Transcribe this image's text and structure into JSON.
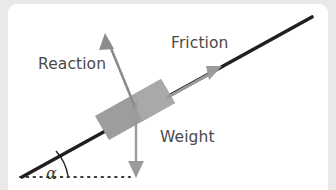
{
  "figure": {
    "background_color": "#e9e9e9",
    "card_color": "#ffffff"
  },
  "labels": {
    "reaction": "Reaction",
    "friction": "Friction",
    "weight": "Weight",
    "angle": "α"
  },
  "colors": {
    "incline": "#231f20",
    "block_fill": "#9e9e9e",
    "block_fill_light": "#b0b0b0",
    "arrow_gray": "#8c8c8c",
    "label_text": "#4a4a4a",
    "angle_text": "#3a3a3a",
    "dotted_baseline": "#3a3a3a"
  },
  "geometry": {
    "incline": {
      "x1": 22,
      "y1": 176,
      "x2": 312,
      "y2": 15,
      "stroke_width": 3.4
    },
    "baseline_dotted": {
      "x1": 20,
      "y1": 177,
      "x2": 128,
      "y2": 177,
      "dash": "1.6 5.2"
    },
    "angle_arc": {
      "center_x": 22,
      "center_y": 176,
      "radius": 46,
      "label": "α"
    },
    "block": {
      "corners": [
        [
          95,
          113
        ],
        [
          161,
          75
        ],
        [
          175,
          99
        ],
        [
          109,
          137
        ]
      ],
      "rotation_deg": -29
    },
    "arrows": [
      {
        "name": "reaction",
        "x1": 134,
        "y1": 103,
        "x2": 104,
        "y2": 36,
        "color": "#8c8c8c",
        "head": "up-left"
      },
      {
        "name": "friction",
        "x1": 170,
        "y1": 92,
        "x2": 220,
        "y2": 63,
        "color": "#9a9a9a",
        "head": "up-right"
      },
      {
        "name": "weight",
        "x1": 135,
        "y1": 100,
        "x2": 135,
        "y2": 176,
        "color": "#9a9a9a",
        "head": "down"
      }
    ]
  }
}
